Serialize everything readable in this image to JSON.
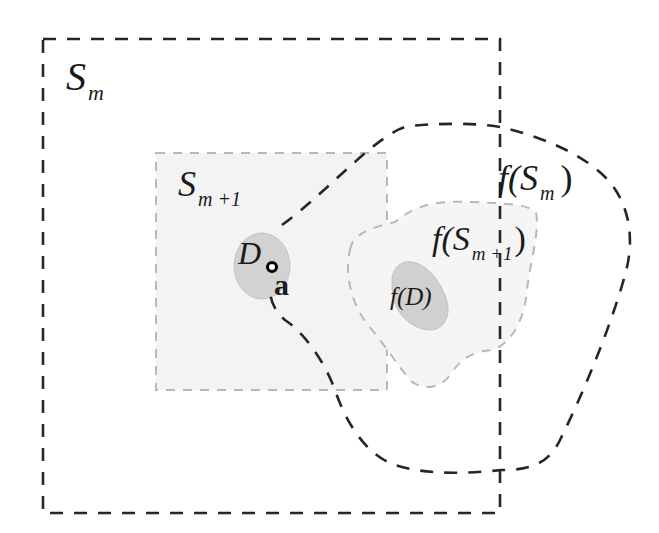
{
  "diagram": {
    "type": "set-mapping illustration",
    "colors": {
      "background": "#ffffff",
      "outer_dash": "#2a2a2a",
      "inner_dash": "#b5b5b5",
      "inner_fill": "#f2f2f2",
      "region_fill": "#d0d0d0",
      "point": "#000000"
    },
    "sets": [
      {
        "id": "S_m",
        "shape": "dashed-rectangle",
        "label_main": "S",
        "label_sub": "m"
      },
      {
        "id": "S_m+1",
        "shape": "dashed-rectangle",
        "label_main": "S",
        "label_sub": "m +1"
      },
      {
        "id": "D",
        "shape": "filled-disc",
        "label_main": "D"
      },
      {
        "id": "f(S_m)",
        "shape": "dashed-closed-curve",
        "label_prefix": "f(",
        "label_main": "S",
        "label_sub": "m",
        "label_suffix": ")"
      },
      {
        "id": "f(S_m+1)",
        "shape": "dashed-closed-curve",
        "label_prefix": "f(",
        "label_main": "S",
        "label_sub": "m +1",
        "label_suffix": ")"
      },
      {
        "id": "f(D)",
        "shape": "filled-blob",
        "label": "f(D)"
      }
    ],
    "point": {
      "label": "a",
      "marker": "hollow-dot"
    }
  }
}
